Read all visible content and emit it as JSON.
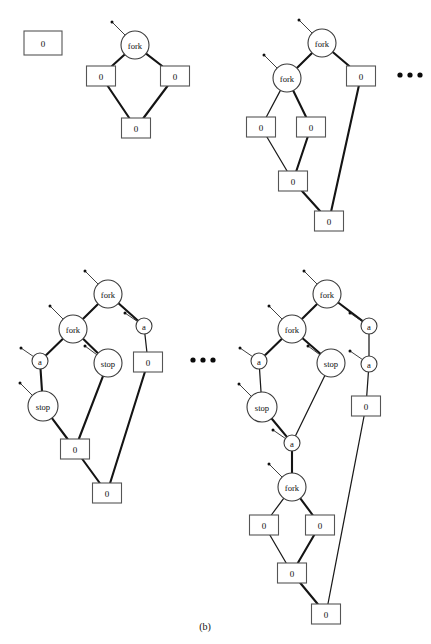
{
  "figure": {
    "caption": "(b)",
    "caption_x": 205,
    "caption_y": 630,
    "background": "#ffffff",
    "edge_color": "#141414",
    "node_fill": "#ffffff",
    "node_stroke": "#3a3a3a"
  },
  "labels": {
    "fork": "fork",
    "stop": "stop",
    "a": "a",
    "zero": "0",
    "ellipsis": "• • •"
  },
  "graphs": [
    {
      "name": "graph-1-initial",
      "nodes": [
        {
          "id": "g1-box-standalone",
          "kind": "box",
          "label": "0",
          "x": 43,
          "y": 43,
          "w": 38,
          "h": 24
        },
        {
          "id": "g1-fork",
          "kind": "circle",
          "label": "fork",
          "x": 135,
          "y": 45,
          "r": 14
        },
        {
          "id": "g1-box-left",
          "kind": "box",
          "label": "0",
          "x": 101,
          "y": 76,
          "w": 29,
          "h": 20
        },
        {
          "id": "g1-box-right",
          "kind": "box",
          "label": "0",
          "x": 175,
          "y": 76,
          "w": 29,
          "h": 20
        },
        {
          "id": "g1-box-bottom",
          "kind": "box",
          "label": "0",
          "x": 136,
          "y": 128,
          "w": 29,
          "h": 20
        }
      ],
      "edges": [
        {
          "from": "g1-fork",
          "to": "g1-box-left",
          "weight": "thick"
        },
        {
          "from": "g1-fork",
          "to": "g1-box-right",
          "weight": "thick"
        },
        {
          "from": "g1-box-left",
          "to": "g1-box-bottom",
          "weight": "thick"
        },
        {
          "from": "g1-box-right",
          "to": "g1-box-bottom",
          "weight": "thick"
        }
      ],
      "stubs": [
        {
          "node": "g1-fork",
          "dx": -23,
          "dy": -23
        }
      ],
      "ellipsis": null
    },
    {
      "name": "graph-2-one-fork-unfolded",
      "nodes": [
        {
          "id": "g2-fork-top",
          "kind": "circle",
          "label": "fork",
          "x": 322,
          "y": 43,
          "r": 14
        },
        {
          "id": "g2-fork-mid",
          "kind": "circle",
          "label": "fork",
          "x": 287,
          "y": 78,
          "r": 14
        },
        {
          "id": "g2-box-right",
          "kind": "box",
          "label": "0",
          "x": 361,
          "y": 76,
          "w": 29,
          "h": 20
        },
        {
          "id": "g2-box-left",
          "kind": "box",
          "label": "0",
          "x": 261,
          "y": 127,
          "w": 29,
          "h": 20
        },
        {
          "id": "g2-box-mid",
          "kind": "box",
          "label": "0",
          "x": 311,
          "y": 127,
          "w": 29,
          "h": 20
        },
        {
          "id": "g2-box-join",
          "kind": "box",
          "label": "0",
          "x": 293,
          "y": 181,
          "w": 29,
          "h": 20
        },
        {
          "id": "g2-box-bottom",
          "kind": "box",
          "label": "0",
          "x": 329,
          "y": 221,
          "w": 29,
          "h": 20
        }
      ],
      "edges": [
        {
          "from": "g2-fork-top",
          "to": "g2-fork-mid",
          "weight": "thick"
        },
        {
          "from": "g2-fork-top",
          "to": "g2-box-right",
          "weight": "thick"
        },
        {
          "from": "g2-fork-mid",
          "to": "g2-box-left",
          "weight": "thin"
        },
        {
          "from": "g2-fork-mid",
          "to": "g2-box-mid",
          "weight": "thick"
        },
        {
          "from": "g2-box-left",
          "to": "g2-box-join",
          "weight": "thin"
        },
        {
          "from": "g2-box-mid",
          "to": "g2-box-join",
          "weight": "thick"
        },
        {
          "from": "g2-box-join",
          "to": "g2-box-bottom",
          "weight": "thick"
        },
        {
          "from": "g2-box-right",
          "to": "g2-box-bottom",
          "weight": "thick"
        }
      ],
      "stubs": [
        {
          "node": "g2-fork-top",
          "dx": -23,
          "dy": -23
        },
        {
          "node": "g2-fork-mid",
          "dx": -23,
          "dy": -23
        }
      ],
      "ellipsis": {
        "x": 400,
        "y": 75
      }
    },
    {
      "name": "graph-3-actions-introduced",
      "nodes": [
        {
          "id": "g3-fork-top",
          "kind": "circle",
          "label": "fork",
          "x": 108,
          "y": 294,
          "r": 14
        },
        {
          "id": "g3-fork-mid",
          "kind": "circle",
          "label": "fork",
          "x": 73,
          "y": 329,
          "r": 14
        },
        {
          "id": "g3-a-right",
          "kind": "circle",
          "label": "a",
          "x": 144,
          "y": 326,
          "r": 8
        },
        {
          "id": "g3-a-left",
          "kind": "circle",
          "label": "a",
          "x": 40,
          "y": 361,
          "r": 8
        },
        {
          "id": "g3-stop-right",
          "kind": "circle",
          "label": "stop",
          "x": 108,
          "y": 363,
          "r": 14
        },
        {
          "id": "g3-box-right",
          "kind": "box",
          "label": "0",
          "x": 148,
          "y": 362,
          "w": 29,
          "h": 20
        },
        {
          "id": "g3-stop-left",
          "kind": "circle",
          "label": "stop",
          "x": 43,
          "y": 406,
          "r": 15
        },
        {
          "id": "g3-box-join",
          "kind": "box",
          "label": "0",
          "x": 75,
          "y": 449,
          "w": 29,
          "h": 20
        },
        {
          "id": "g3-box-bottom",
          "kind": "box",
          "label": "0",
          "x": 107,
          "y": 493,
          "w": 29,
          "h": 20
        }
      ],
      "edges": [
        {
          "from": "g3-fork-top",
          "to": "g3-fork-mid",
          "weight": "thick"
        },
        {
          "from": "g3-fork-top",
          "to": "g3-a-right",
          "weight": "thick"
        },
        {
          "from": "g3-fork-mid",
          "to": "g3-a-left",
          "weight": "thick"
        },
        {
          "from": "g3-fork-mid",
          "to": "g3-stop-right",
          "weight": "thick"
        },
        {
          "from": "g3-a-right",
          "to": "g3-box-right",
          "weight": "thin"
        },
        {
          "from": "g3-a-left",
          "to": "g3-stop-left",
          "weight": "thick"
        },
        {
          "from": "g3-stop-left",
          "to": "g3-box-join",
          "weight": "thick"
        },
        {
          "from": "g3-stop-right",
          "to": "g3-box-join",
          "weight": "thick"
        },
        {
          "from": "g3-box-join",
          "to": "g3-box-bottom",
          "weight": "thick"
        },
        {
          "from": "g3-box-right",
          "to": "g3-box-bottom",
          "weight": "thick"
        }
      ],
      "stubs": [
        {
          "node": "g3-fork-top",
          "dx": -23,
          "dy": -23
        },
        {
          "node": "g3-fork-mid",
          "dx": -23,
          "dy": -23
        },
        {
          "node": "g3-a-right",
          "dx": -19,
          "dy": -13
        },
        {
          "node": "g3-a-left",
          "dx": -19,
          "dy": -13
        },
        {
          "node": "g3-stop-right",
          "dx": -23,
          "dy": -17
        },
        {
          "node": "g3-stop-left",
          "dx": -23,
          "dy": -23
        }
      ],
      "ellipsis": {
        "x": 193,
        "y": 360
      }
    },
    {
      "name": "graph-4-second-fork-unfolded",
      "nodes": [
        {
          "id": "g4-fork-top",
          "kind": "circle",
          "label": "fork",
          "x": 327,
          "y": 294,
          "r": 14
        },
        {
          "id": "g4-fork-mid",
          "kind": "circle",
          "label": "fork",
          "x": 292,
          "y": 329,
          "r": 14
        },
        {
          "id": "g4-a-r1",
          "kind": "circle",
          "label": "a",
          "x": 369,
          "y": 326,
          "r": 8
        },
        {
          "id": "g4-a-left",
          "kind": "circle",
          "label": "a",
          "x": 259,
          "y": 361,
          "r": 8
        },
        {
          "id": "g4-stop-right",
          "kind": "circle",
          "label": "stop",
          "x": 331,
          "y": 363,
          "r": 14
        },
        {
          "id": "g4-a-r2",
          "kind": "circle",
          "label": "a",
          "x": 369,
          "y": 364,
          "r": 8
        },
        {
          "id": "g4-stop-left",
          "kind": "circle",
          "label": "stop",
          "x": 262,
          "y": 407,
          "r": 15
        },
        {
          "id": "g4-box-right",
          "kind": "box",
          "label": "0",
          "x": 366,
          "y": 406,
          "w": 29,
          "h": 20
        },
        {
          "id": "g4-a-join",
          "kind": "circle",
          "label": "a",
          "x": 292,
          "y": 443,
          "r": 8
        },
        {
          "id": "g4-fork-bottom",
          "kind": "circle",
          "label": "fork",
          "x": 292,
          "y": 487,
          "r": 14
        },
        {
          "id": "g4-box-bl",
          "kind": "box",
          "label": "0",
          "x": 264,
          "y": 525,
          "w": 29,
          "h": 20
        },
        {
          "id": "g4-box-br",
          "kind": "box",
          "label": "0",
          "x": 320,
          "y": 525,
          "w": 29,
          "h": 20
        },
        {
          "id": "g4-box-join",
          "kind": "box",
          "label": "0",
          "x": 292,
          "y": 573,
          "w": 29,
          "h": 20
        },
        {
          "id": "g4-box-bottom",
          "kind": "box",
          "label": "0",
          "x": 326,
          "y": 614,
          "w": 29,
          "h": 20
        }
      ],
      "edges": [
        {
          "from": "g4-fork-top",
          "to": "g4-fork-mid",
          "weight": "thick"
        },
        {
          "from": "g4-fork-top",
          "to": "g4-a-r1",
          "weight": "thick"
        },
        {
          "from": "g4-fork-mid",
          "to": "g4-a-left",
          "weight": "thick"
        },
        {
          "from": "g4-fork-mid",
          "to": "g4-stop-right",
          "weight": "thick"
        },
        {
          "from": "g4-a-r1",
          "to": "g4-a-r2",
          "weight": "thin"
        },
        {
          "from": "g4-a-left",
          "to": "g4-stop-left",
          "weight": "thin"
        },
        {
          "from": "g4-a-r2",
          "to": "g4-box-right",
          "weight": "thin"
        },
        {
          "from": "g4-stop-left",
          "to": "g4-a-join",
          "weight": "thick"
        },
        {
          "from": "g4-stop-right",
          "to": "g4-a-join",
          "weight": "thin"
        },
        {
          "from": "g4-a-join",
          "to": "g4-fork-bottom",
          "weight": "thick"
        },
        {
          "from": "g4-fork-bottom",
          "to": "g4-box-bl",
          "weight": "thin"
        },
        {
          "from": "g4-fork-bottom",
          "to": "g4-box-br",
          "weight": "thick"
        },
        {
          "from": "g4-box-bl",
          "to": "g4-box-join",
          "weight": "thin"
        },
        {
          "from": "g4-box-br",
          "to": "g4-box-join",
          "weight": "thick"
        },
        {
          "from": "g4-box-join",
          "to": "g4-box-bottom",
          "weight": "thick"
        },
        {
          "from": "g4-box-right",
          "to": "g4-box-bottom",
          "weight": "thin"
        }
      ],
      "stubs": [
        {
          "node": "g4-fork-top",
          "dx": -23,
          "dy": -23
        },
        {
          "node": "g4-fork-mid",
          "dx": -23,
          "dy": -23
        },
        {
          "node": "g4-a-r1",
          "dx": -19,
          "dy": -13
        },
        {
          "node": "g4-a-left",
          "dx": -19,
          "dy": -13
        },
        {
          "node": "g4-stop-right",
          "dx": -23,
          "dy": -17
        },
        {
          "node": "g4-a-r2",
          "dx": -19,
          "dy": -13
        },
        {
          "node": "g4-stop-left",
          "dx": -23,
          "dy": -23
        },
        {
          "node": "g4-a-join",
          "dx": -19,
          "dy": -13
        },
        {
          "node": "g4-fork-bottom",
          "dx": -23,
          "dy": -23
        }
      ],
      "ellipsis": null
    }
  ]
}
